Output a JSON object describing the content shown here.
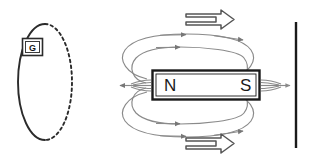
{
  "figure": {
    "background_color": "#ffffff",
    "width": 315,
    "height": 167
  },
  "colors": {
    "ink": "#2b2b2b",
    "field_line": "#8a8a8a",
    "magnet_outline": "#1a1a1a",
    "magnet_fill": "#ffffff",
    "motion_arrow": "#555555",
    "screen_line": "#1a1a1a"
  },
  "coil": {
    "name": "conducting-loop",
    "solid_half_label": "front half of loop",
    "dashed_half_label": "back half of loop",
    "center_x": 45,
    "center_y": 82,
    "radius_x": 27,
    "radius_y": 58
  },
  "galvanometer": {
    "label": "G",
    "box_x": 22,
    "box_y": 38,
    "box_width": 21,
    "box_height": 18
  },
  "magnet": {
    "north_label": "N",
    "south_label": "S",
    "x": 152,
    "y": 70,
    "width": 108,
    "height": 30
  },
  "field_lines": {
    "count_label": "magnetic field lines",
    "arrow_direction": "N to S outside magnet",
    "loops": [
      {
        "name": "upper-field-loop",
        "arrowheads": 2
      },
      {
        "name": "lower-field-loop",
        "arrowheads": 2
      }
    ],
    "pole_fan_left": {
      "name": "north-pole-fan",
      "arrow_direction": "left"
    },
    "pole_fan_right": {
      "name": "south-pole-fan",
      "arrow_direction": "right"
    }
  },
  "motion_arrows": [
    {
      "name": "motion-arrow-top",
      "direction": "right",
      "x": 186,
      "y": 20
    },
    {
      "name": "motion-arrow-bottom",
      "direction": "right",
      "x": 186,
      "y": 144
    }
  ],
  "screen": {
    "name": "vertical-reference-line",
    "x": 296,
    "y_top": 22,
    "y_bottom": 148
  }
}
